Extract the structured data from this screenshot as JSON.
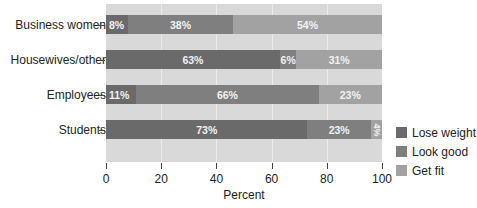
{
  "chart_data": {
    "type": "bar",
    "orientation": "horizontal",
    "stacked": true,
    "title": "",
    "xlabel": "Percent",
    "ylabel": "",
    "xlim": [
      0,
      100
    ],
    "xticks": [
      "0",
      "20",
      "40",
      "60",
      "80",
      "100"
    ],
    "grid": true,
    "legend_position": "right-bottom",
    "categories": [
      "Business women",
      "Housewives/other",
      "Employees",
      "Students"
    ],
    "series": [
      {
        "name": "Lose weight",
        "color": "#6a6a6a",
        "values": [
          8,
          63,
          11,
          73
        ]
      },
      {
        "name": "Look good",
        "color": "#7f7f7f",
        "values": [
          38,
          6,
          66,
          23
        ]
      },
      {
        "name": "Get fit",
        "color": "#a2a2a2",
        "values": [
          54,
          31,
          23,
          4
        ]
      }
    ],
    "data_labels": [
      [
        "8%",
        "38%",
        "54%"
      ],
      [
        "63%",
        "6%",
        "31%"
      ],
      [
        "11%",
        "66%",
        "23%"
      ],
      [
        "73%",
        "23%",
        "4%"
      ]
    ]
  }
}
